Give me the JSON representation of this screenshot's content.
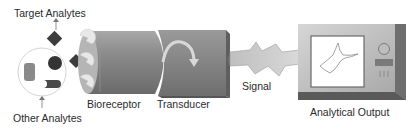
{
  "diagram": {
    "labels": {
      "target_analytes": "Target Analytes",
      "other_analytes": "Other Analytes",
      "bioreceptor": "Bioreceptor",
      "transducer": "Transducer",
      "signal": "Signal",
      "analytical_output": "Analytical Output"
    },
    "components": [
      {
        "id": "target-analytes",
        "shape": "diamond",
        "count": 2
      },
      {
        "id": "other-analytes",
        "shapes": [
          "cylinder",
          "sphere",
          "half-moon-block"
        ]
      },
      {
        "id": "bioreceptor",
        "shape": "cylinder-with-receptor-sites",
        "receptor_sites": 3
      },
      {
        "id": "transducer",
        "shape": "box-with-curved-arrow"
      },
      {
        "id": "signal",
        "shape": "lightning-bolt"
      },
      {
        "id": "analytical-output",
        "shape": "monitor",
        "screen_plot": "cyclic-voltammogram",
        "controls": [
          "knob",
          "slot",
          "vents"
        ]
      }
    ],
    "flow": [
      "Target Analytes",
      "Bioreceptor",
      "Transducer",
      "Signal",
      "Analytical Output"
    ],
    "colors": {
      "dark_analyte": "#3a3a3a",
      "bioreceptor_body": "#8a8a8a",
      "transducer_body": "#7e7e7e",
      "device_frame": "#bdbdbd",
      "screen": "#ffffff",
      "receptor_site": "#e8e8e8"
    }
  }
}
